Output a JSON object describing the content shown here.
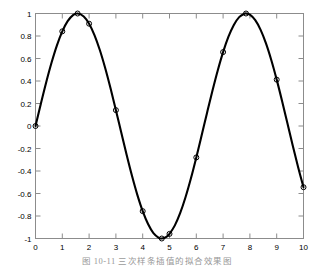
{
  "figure": {
    "caption": "图 10-11   三次样条插值的拟合效果图",
    "background_color": "#ffffff",
    "axis_color": "#8c8c8c",
    "curve_color": "#000000"
  },
  "chart_data": {
    "type": "line",
    "title": "",
    "xlabel": "",
    "ylabel": "",
    "xlim": [
      0,
      10
    ],
    "ylim": [
      -1,
      1
    ],
    "grid": false,
    "legend": null,
    "xticks": [
      0,
      1,
      2,
      3,
      4,
      5,
      6,
      7,
      8,
      9,
      10
    ],
    "xtick_labels": [
      "0",
      "1",
      "2",
      "3",
      "4",
      "5",
      "6",
      "7",
      "8",
      "9",
      "10"
    ],
    "yticks": [
      -1,
      -0.8,
      -0.6,
      -0.4,
      -0.2,
      0,
      0.2,
      0.4,
      0.6,
      0.8,
      1
    ],
    "ytick_labels": [
      "-1",
      "-0.8",
      "-0.6",
      "-0.4",
      "-0.2",
      "0",
      "0.2",
      "0.4",
      "0.6",
      "0.8",
      "1"
    ],
    "series": [
      {
        "name": "spline-curve",
        "style": "solid",
        "color": "#000000",
        "linewidth": 2.1,
        "marker": "none",
        "x": [
          0,
          0.2,
          0.4,
          0.6,
          0.8,
          1,
          1.2,
          1.4,
          1.5708,
          1.8,
          2,
          2.2,
          2.4,
          2.6,
          2.8,
          3,
          3.2,
          3.4,
          3.6,
          3.8,
          4,
          4.2,
          4.4,
          4.6,
          4.7124,
          4.9,
          5,
          5.2,
          5.4,
          5.6,
          5.8,
          6,
          6.2,
          6.4,
          6.6,
          6.8,
          7,
          7.2,
          7.4,
          7.6,
          7.8,
          7.854,
          8,
          8.2,
          8.4,
          8.6,
          8.8,
          9,
          9.2,
          9.4,
          9.6,
          9.8,
          10
        ],
        "y": [
          0,
          0.1987,
          0.3894,
          0.5646,
          0.7174,
          0.8415,
          0.932,
          0.9854,
          1,
          0.9738,
          0.9093,
          0.8085,
          0.6755,
          0.5155,
          0.335,
          0.1411,
          -0.0584,
          -0.2555,
          -0.4425,
          -0.6119,
          -0.7568,
          -0.8716,
          -0.9516,
          -0.9937,
          -1,
          -0.9825,
          -0.9589,
          -0.8835,
          -0.7728,
          -0.6313,
          -0.4646,
          -0.2794,
          -0.0831,
          0.1165,
          0.3115,
          0.4941,
          0.657,
          0.7937,
          0.8987,
          0.9679,
          0.9989,
          1,
          0.9894,
          0.9407,
          0.8546,
          0.7344,
          0.585,
          0.4121,
          0.2226,
          0.0237,
          -0.1761,
          -0.3665,
          -0.544
        ]
      },
      {
        "name": "sample-points",
        "style": "markers",
        "marker": "circle",
        "marker_size": 5,
        "color": "#000000",
        "x": [
          0,
          1,
          1.5708,
          2,
          3,
          4,
          4.7124,
          5,
          6,
          7,
          7.854,
          9,
          10
        ],
        "y": [
          0,
          0.8415,
          1,
          0.9093,
          0.1411,
          -0.7568,
          -1,
          -0.9589,
          -0.2794,
          0.657,
          1,
          0.4121,
          -0.544
        ]
      }
    ]
  }
}
